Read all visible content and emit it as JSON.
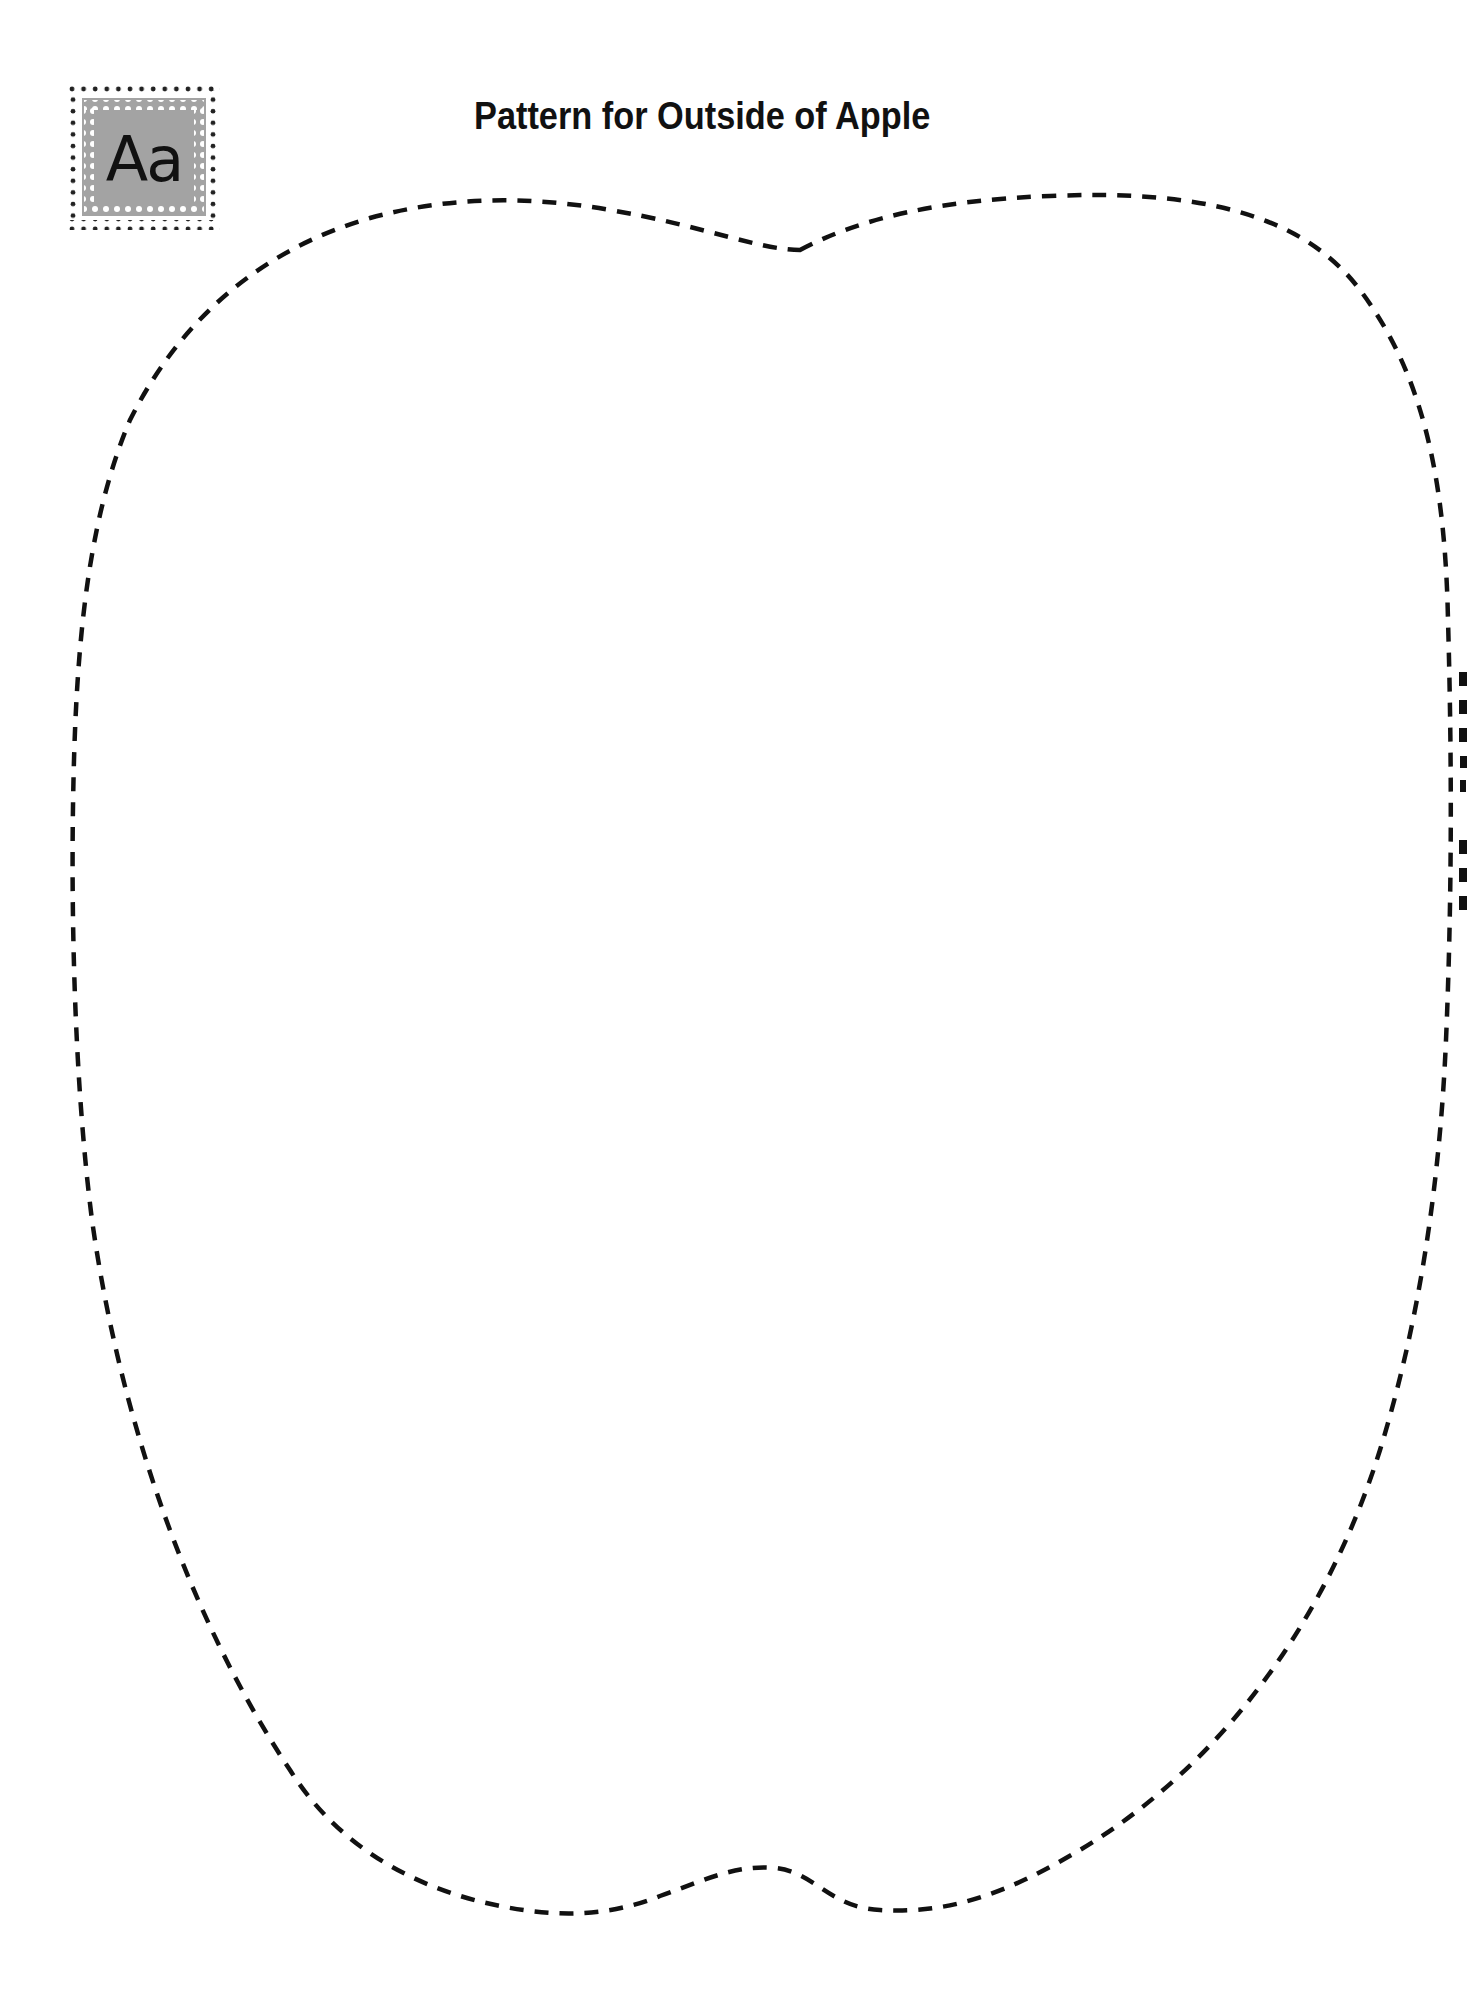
{
  "page": {
    "title": "Pattern for Outside of Apple",
    "badge": {
      "letters": "Aa",
      "icon": "alphabet-badge-icon",
      "colors": {
        "fill": "#a3a3a3",
        "dots_outer": "#222222",
        "dots_inner": "#ffffff",
        "text": "#111111"
      }
    },
    "pattern": {
      "shape": "apple-outline",
      "line_style": "dashed",
      "stroke_color": "#111111"
    }
  }
}
